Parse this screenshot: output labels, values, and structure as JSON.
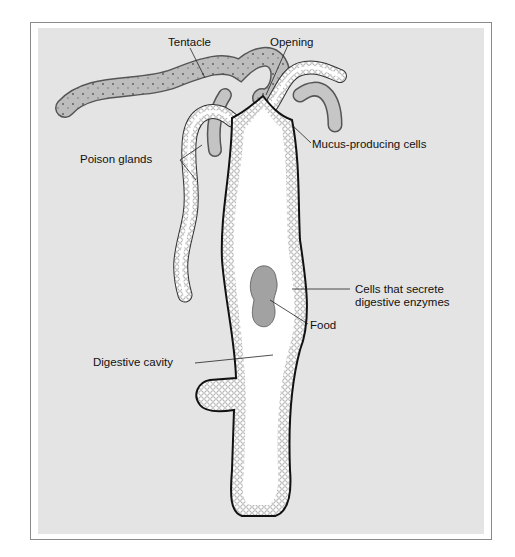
{
  "diagram": {
    "colors": {
      "panel": "#e4e4e4",
      "frame": "#8a8a8a",
      "body_fill": "#ffffff",
      "outline": "#111111",
      "tentacle_fill": "#b8b8b8",
      "food": "#9a9a9a"
    },
    "labels": {
      "tentacle": "Tentacle",
      "opening": "Opening",
      "mucus": "Mucus-producing cells",
      "poison": "Poison glands",
      "enzymes_line1": "Cells that secrete",
      "enzymes_line2": "digestive enzymes",
      "food": "Food",
      "cavity": "Digestive cavity"
    }
  }
}
